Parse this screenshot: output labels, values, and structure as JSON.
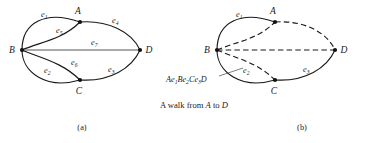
{
  "figure": {
    "caption": {
      "prefix": "A walk from ",
      "from_vertex": "A",
      "middle": " to ",
      "to_vertex": "D"
    },
    "panels": [
      {
        "id": "panel-a",
        "label": "(a)",
        "vertices": [
          {
            "name": "A",
            "x": 80,
            "y": 22
          },
          {
            "name": "B",
            "x": 22,
            "y": 50
          },
          {
            "name": "C",
            "x": 80,
            "y": 80
          },
          {
            "name": "D",
            "x": 140,
            "y": 50
          }
        ],
        "edges": [
          {
            "id": "e1",
            "label": "e",
            "subscript": "1",
            "from": "B",
            "to": "A",
            "style": "solid",
            "label_x": 41,
            "label_y": 17
          },
          {
            "id": "e5",
            "label": "e",
            "subscript": "5",
            "from": "B",
            "to": "A",
            "style": "solid",
            "label_x": 56,
            "label_y": 33
          },
          {
            "id": "e7",
            "label": "e",
            "subscript": "7",
            "from": "B",
            "to": "D",
            "style": "solid",
            "label_x": 91,
            "label_y": 45
          },
          {
            "id": "e4",
            "label": "e",
            "subscript": "4",
            "from": "A",
            "to": "D",
            "style": "solid",
            "label_x": 112,
            "label_y": 23
          },
          {
            "id": "e6",
            "label": "e",
            "subscript": "6",
            "from": "B",
            "to": "C",
            "style": "solid",
            "label_x": 71,
            "label_y": 65
          },
          {
            "id": "e2",
            "label": "e",
            "subscript": "2",
            "from": "B",
            "to": "C",
            "style": "solid",
            "label_x": 44,
            "label_y": 73
          },
          {
            "id": "e3",
            "label": "e",
            "subscript": "3",
            "from": "C",
            "to": "D",
            "style": "solid",
            "label_x": 108,
            "label_y": 72
          }
        ]
      },
      {
        "id": "panel-b",
        "label": "(b)",
        "vertices": [
          {
            "name": "A",
            "x": 275,
            "y": 22
          },
          {
            "name": "B",
            "x": 217,
            "y": 50
          },
          {
            "name": "C",
            "x": 275,
            "y": 80
          },
          {
            "name": "D",
            "x": 335,
            "y": 50
          }
        ],
        "edges": [
          {
            "id": "e1",
            "label": "e",
            "subscript": "1",
            "from": "B",
            "to": "A",
            "style": "solid",
            "label_x": 236,
            "label_y": 17
          },
          {
            "id": "e5",
            "label": "",
            "subscript": "",
            "from": "B",
            "to": "A",
            "style": "dashed",
            "label_x": 0,
            "label_y": 0
          },
          {
            "id": "e7",
            "label": "",
            "subscript": "",
            "from": "B",
            "to": "D",
            "style": "dashed",
            "label_x": 0,
            "label_y": 0
          },
          {
            "id": "e4",
            "label": "",
            "subscript": "",
            "from": "A",
            "to": "D",
            "style": "dashed",
            "label_x": 0,
            "label_y": 0
          },
          {
            "id": "e6",
            "label": "",
            "subscript": "",
            "from": "B",
            "to": "C",
            "style": "dashed",
            "label_x": 0,
            "label_y": 0
          },
          {
            "id": "e2",
            "label": "e",
            "subscript": "2",
            "from": "B",
            "to": "C",
            "style": "solid",
            "label_x": 243,
            "label_y": 73
          },
          {
            "id": "e3",
            "label": "e",
            "subscript": "3",
            "from": "C",
            "to": "D",
            "style": "solid",
            "label_x": 303,
            "label_y": 72
          }
        ],
        "walk_annotation": {
          "parts": [
            {
              "text": "A",
              "sub": ""
            },
            {
              "text": "e",
              "sub": "1"
            },
            {
              "text": "B",
              "sub": ""
            },
            {
              "text": "e",
              "sub": "2"
            },
            {
              "text": "C",
              "sub": ""
            },
            {
              "text": "e",
              "sub": "3"
            },
            {
              "text": "D",
              "sub": ""
            }
          ],
          "full_text": "Ae1Be2Ce3D",
          "x": 166,
          "y": 82
        }
      }
    ],
    "colors": {
      "ink": "#1a1a1a",
      "faint_ink": "#555555",
      "background": "#ffffff"
    }
  }
}
